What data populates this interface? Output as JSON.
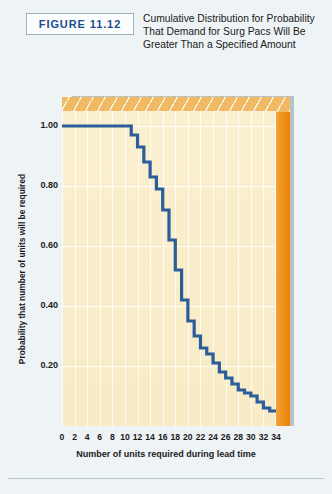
{
  "header": {
    "figure_label": "FIGURE 11.12",
    "caption": "Cumulative Distribution for Probability That Demand for Surg Pacs Will Be Greater Than a Specified Amount"
  },
  "colors": {
    "page_background": "#eef3f5",
    "figure_label_text": "#1b4f8a",
    "figure_box_border": "#9fb3c4",
    "plot_face": "#f8ebc6",
    "plot_top_face": "#f0b963",
    "plot_right_face": "#ef8f16",
    "plot_shadow": "#b9c1c6",
    "curve": "#2b5d9b",
    "gridline": "#ffffff"
  },
  "chart_data": {
    "type": "line",
    "title": "Cumulative Distribution for Probability That Demand for Surg Pacs Will Be Greater Than a Specified Amount",
    "xlabel": "Number of units required during lead time",
    "ylabel": "Probability that number of units will be required",
    "xlim": [
      0,
      34
    ],
    "ylim": [
      0,
      1.05
    ],
    "xticks": [
      0,
      2,
      4,
      6,
      8,
      10,
      12,
      14,
      16,
      18,
      20,
      22,
      24,
      26,
      28,
      30,
      32,
      34
    ],
    "xtick_labels": [
      "0",
      "2",
      "4",
      "6",
      "8",
      "10",
      "12",
      "14",
      "16",
      "18",
      "20",
      "22",
      "24",
      "26",
      "28",
      "30",
      "32",
      "34"
    ],
    "yticks": [
      0.2,
      0.4,
      0.6,
      0.8,
      1.0
    ],
    "ytick_labels": [
      "0.20",
      "0.40",
      "0.60",
      "0.80",
      "1.00"
    ],
    "grid": true,
    "legend": null,
    "step_style": "post-decreasing",
    "x": [
      0,
      2,
      4,
      6,
      8,
      10,
      11,
      12,
      13,
      14,
      15,
      16,
      17,
      18,
      19,
      20,
      21,
      22,
      23,
      24,
      25,
      26,
      27,
      28,
      29,
      30,
      31,
      32,
      33,
      34
    ],
    "values": [
      1.0,
      1.0,
      1.0,
      1.0,
      1.0,
      1.0,
      0.97,
      0.93,
      0.88,
      0.83,
      0.79,
      0.72,
      0.62,
      0.52,
      0.42,
      0.35,
      0.3,
      0.26,
      0.24,
      0.21,
      0.18,
      0.16,
      0.14,
      0.12,
      0.11,
      0.1,
      0.08,
      0.06,
      0.05,
      0.05
    ]
  },
  "axes": {
    "y_axis_title": "Probability that number of units will be required",
    "x_axis_title": "Number of units required during lead time"
  }
}
